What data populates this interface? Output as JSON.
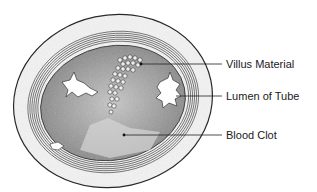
{
  "diagram": {
    "type": "cross-section illustration",
    "labels": [
      {
        "id": "villus",
        "text": "Villus Material",
        "line_y": 64,
        "line_x1": 141,
        "line_x2": 222
      },
      {
        "id": "lumen",
        "text": "Lumen of Tube",
        "line_y": 96,
        "line_x1": 176,
        "line_x2": 222
      },
      {
        "id": "clot",
        "text": "Blood Clot",
        "line_y": 135,
        "line_x1": 124,
        "line_x2": 222
      }
    ]
  }
}
